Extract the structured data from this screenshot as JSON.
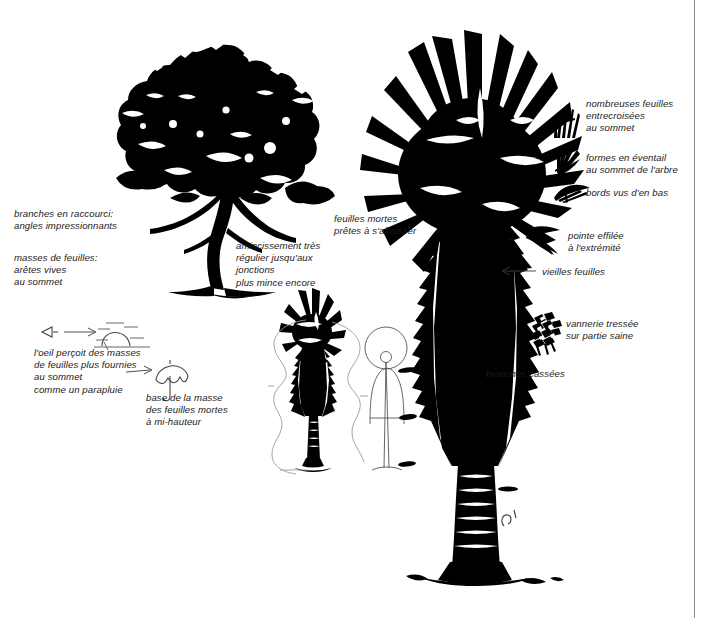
{
  "figure": {
    "kind": "botanical-silhouette-plate",
    "language": "fr",
    "background_color": "#ffffff",
    "ink_color": "#000000",
    "frame_rule_color": "#8d8d8d"
  },
  "subjects": [
    {
      "id": "broadleaf-tree",
      "name": "arbre à feuillage large (silhouette)"
    },
    {
      "id": "large-palm",
      "name": "grand palmier (silhouette)"
    },
    {
      "id": "small-palm",
      "name": "petit palmier (silhouette)"
    },
    {
      "id": "human-figure",
      "name": "silhouette humaine (échelle)"
    },
    {
      "id": "outline-shapes",
      "name": "formes au trait (repères)"
    }
  ],
  "annotations": {
    "left": [
      {
        "id": "branches-raccourci",
        "text": "branches en raccourci:\nangles impressionnants"
      },
      {
        "id": "masses-feuilles",
        "text": "masses de feuilles:\narêtes vives\nau sommet"
      },
      {
        "id": "oeil-percoit",
        "text": "l'oeil perçoit des masses\nde feuilles plus fournies\nau sommet\ncomme un parapluie"
      },
      {
        "id": "base-masse",
        "text": "base de la masse\ndes feuilles mortes\nà mi-hauteur"
      }
    ],
    "center": [
      {
        "id": "amincissement",
        "text": "amincissement très\nrégulier jusqu'aux\njonctions\nplus mince encore"
      },
      {
        "id": "feuilles-mortes",
        "text": "feuilles mortes\nprêtes à s'affaisser"
      }
    ],
    "right": [
      {
        "id": "nombreuses-feuilles",
        "text": "nombreuses feuilles\nentrecroisées\nau sommet"
      },
      {
        "id": "formes-eventail",
        "text": "formes en éventail\nau sommet de l'arbre"
      },
      {
        "id": "bords-vus",
        "text": "bords vus d'en bas"
      },
      {
        "id": "pointe-effilee",
        "text": "pointe effilée\nà l'extrémité"
      },
      {
        "id": "vieilles-feuilles",
        "text": "vieilles feuilles"
      },
      {
        "id": "vannerie",
        "text": "vannerie tressée\nsur partie saine"
      },
      {
        "id": "branches-cassees",
        "text": "branches cassées"
      }
    ]
  },
  "icons": [
    {
      "id": "eye-sketch",
      "name": "eye-icon"
    },
    {
      "id": "dome-sketch",
      "name": "dome-canopy-icon"
    },
    {
      "id": "umbrella-sketch",
      "name": "umbrella-icon"
    },
    {
      "id": "crossed-leaves",
      "name": "crossed-leaves-icon"
    },
    {
      "id": "fan-leaf",
      "name": "fan-leaf-icon"
    },
    {
      "id": "edge-leaf",
      "name": "leaf-edge-icon"
    },
    {
      "id": "pointed-leaf",
      "name": "pointed-leaf-icon"
    },
    {
      "id": "woven-basket",
      "name": "woven-basket-icon"
    }
  ]
}
